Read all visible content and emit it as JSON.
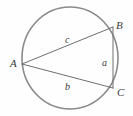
{
  "figure": {
    "kind": "geometry-diagram",
    "width": 133,
    "height": 116,
    "background_color": "#fefefe",
    "circle": {
      "name": "circumscribed-circle",
      "center_x": 70,
      "center_y": 58,
      "radius_x": 48,
      "radius_y": 51,
      "stroke_color": "#8a8a8a",
      "stroke_width": 1.6,
      "fill": "none"
    },
    "triangle": {
      "name": "inscribed-triangle",
      "stroke_color": "#6e6e6e",
      "stroke_width": 1,
      "fill": "none",
      "points": "22,64 113,27 113,88",
      "vertices": [
        {
          "id": "A",
          "label": "A",
          "x": 22,
          "y": 64
        },
        {
          "id": "B",
          "label": "B",
          "x": 113,
          "y": 27
        },
        {
          "id": "C",
          "label": "C",
          "x": 113,
          "y": 88
        }
      ],
      "sides": [
        {
          "id": "a",
          "label": "a",
          "between": "B-C",
          "x": 105,
          "y": 62
        },
        {
          "id": "b",
          "label": "b",
          "between": "A-C",
          "x": 68,
          "y": 87
        },
        {
          "id": "c",
          "label": "c",
          "between": "A-B",
          "x": 68,
          "y": 40
        }
      ]
    }
  }
}
